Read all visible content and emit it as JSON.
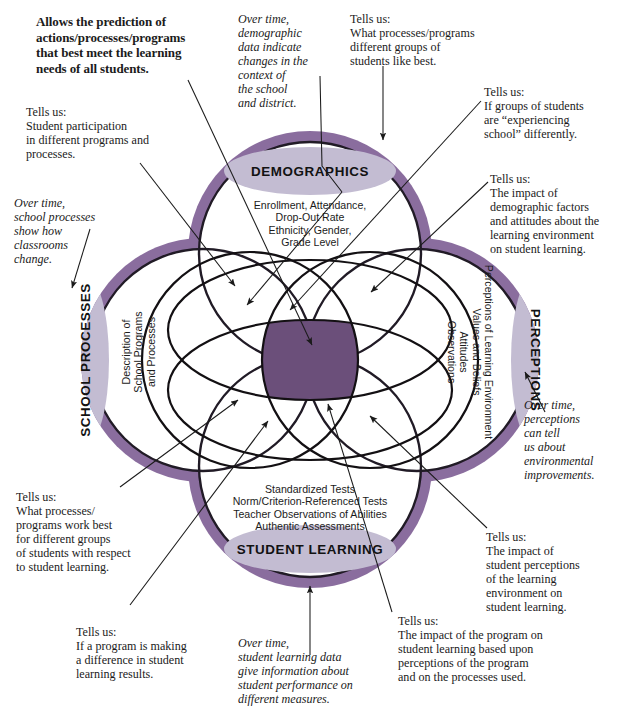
{
  "diagram": {
    "colors": {
      "ring": "#8a6d9e",
      "ring_dark_edge": "#2b2430",
      "label_ellipse": "#c3bcd2",
      "center_overlap": "#6b4f7a",
      "line": "#1a1a1a",
      "page_background": "#ffffff"
    },
    "circles": [
      {
        "id": "demographics",
        "label": "DEMOGRAPHICS",
        "contents": "Enrollment, Attendance,\nDrop-Out Rate\nEthnicity, Gender,\nGrade Level"
      },
      {
        "id": "school-processes",
        "label": "SCHOOL PROCESSES",
        "contents": "Description of\nSchool Programs\nand Processes"
      },
      {
        "id": "perceptions",
        "label": "PERCEPTIONS",
        "contents": "Perceptions of Learning Environment\nValues and Beliefs\nAttitudes\nObservations"
      },
      {
        "id": "student-learning",
        "label": "STUDENT LEARNING",
        "contents": "Standardized Tests\nNorm/Criterion-Referenced Tests\nTeacher Observations of Abilities\nAuthentic Assessments"
      }
    ]
  },
  "annotations": {
    "headline": "Allows the prediction of\nactions/processes/programs\nthat best meet the learning\nneeds of all students.",
    "top_left_tells": "Tells us:\nStudent participation\nin different programs and\nprocesses.",
    "top_mid_overtime": "Over time,\ndemographic\ndata indicate\nchanges in the\ncontext of\nthe school\nand district.",
    "top_right_tells": "Tells us:\nWhat processes/programs\ndifferent groups of\nstudents like best.",
    "upper_right_tells": "Tells us:\nIf groups of students\nare “experiencing\nschool” differently.",
    "right_tells_demographic": "Tells us:\nThe impact of\ndemographic factors\nand attitudes about the\nlearning environment\non student learning.",
    "left_overtime_processes": "Over time,\nschool processes\nshow how\nclassrooms\nchange.",
    "right_overtime_perceptions": "Over time,\nperceptions\ncan tell\nus about\nenvironmental\nimprovements.",
    "lower_left_tells": "Tells us:\nWhat processes/\nprograms work best\nfor different groups\nof students with respect\nto student learning.",
    "lower_right_tells": "Tells us:\nThe impact of\nstudent perceptions\nof the learning\nenvironment on\nstudent learning.",
    "bottom_left_tells": "Tells us:\nIf a program is making\na difference in student\nlearning results.",
    "bottom_mid_overtime": "Over time,\nstudent learning data\ngive information about\nstudent performance on\ndifferent measures.",
    "bottom_right_tells": "Tells us:\nThe impact of the program on\nstudent learning based upon\nperceptions of the program\nand on the processes used."
  }
}
